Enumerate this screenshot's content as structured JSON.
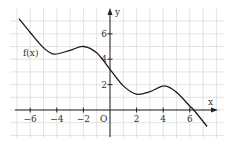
{
  "chart_data": {
    "type": "line",
    "title": "",
    "xlabel": "x",
    "ylabel": "y",
    "origin_label": "O",
    "curve_label": "f(x)",
    "x_ticks": [
      -6,
      -4,
      -2,
      2,
      4,
      6
    ],
    "x_tick_labels": [
      "−6",
      "−4",
      "−2",
      "2",
      "4",
      "6"
    ],
    "y_ticks": [
      2,
      4,
      6
    ],
    "y_tick_labels": [
      "2",
      "4",
      "6"
    ],
    "xlim": [
      -7.5,
      8.5
    ],
    "ylim": [
      -2.2,
      8.0
    ],
    "grid": true,
    "series": [
      {
        "name": "f(x)",
        "x": [
          -6.85,
          -6,
          -5,
          -4.2,
          -3,
          -2,
          -1,
          0,
          1,
          2,
          3,
          4.1,
          5,
          6,
          6.3,
          7.3
        ],
        "values": [
          7.2,
          6.1,
          4.9,
          4.4,
          4.7,
          5.0,
          4.5,
          3.2,
          1.9,
          1.25,
          1.45,
          1.9,
          1.4,
          0.3,
          0.0,
          -1.3
        ]
      }
    ]
  },
  "colors": {
    "grid": "#dcdcdc",
    "axis": "#222222",
    "curve": "#1a1a1a"
  }
}
